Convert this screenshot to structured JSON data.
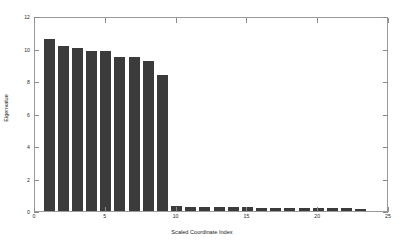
{
  "chart_data": {
    "type": "bar",
    "title": "",
    "xlabel": "Scaled Coordinate Index",
    "ylabel": "Eigenvalue",
    "xlim": [
      0,
      25
    ],
    "ylim": [
      0,
      12
    ],
    "grid": false,
    "legend": null,
    "bar_color": "#3b3b3b",
    "axis_color": "#9a9a9a",
    "background": "#ffffff",
    "xticks": [
      0,
      5,
      10,
      15,
      20,
      25
    ],
    "xtick_labels": [
      "0",
      "5",
      "10",
      "15",
      "20",
      "25"
    ],
    "yticks": [
      0,
      2,
      4,
      6,
      8,
      10,
      12
    ],
    "ytick_labels": [
      "0",
      "2",
      "4",
      "6",
      "8",
      "10",
      "12"
    ],
    "x": [
      1,
      2,
      3,
      4,
      5,
      6,
      7,
      8,
      9,
      10,
      11,
      12,
      13,
      14,
      15,
      16,
      17,
      18,
      19,
      20,
      21,
      22,
      23
    ],
    "values": [
      10.6,
      10.15,
      10.05,
      9.85,
      9.85,
      9.5,
      9.45,
      9.25,
      8.4,
      0.3,
      0.25,
      0.25,
      0.22,
      0.22,
      0.22,
      0.2,
      0.2,
      0.2,
      0.2,
      0.18,
      0.18,
      0.18,
      0.15
    ],
    "categories": [
      "1",
      "2",
      "3",
      "4",
      "5",
      "6",
      "7",
      "8",
      "9",
      "10",
      "11",
      "12",
      "13",
      "14",
      "15",
      "16",
      "17",
      "18",
      "19",
      "20",
      "21",
      "22",
      "23"
    ]
  }
}
